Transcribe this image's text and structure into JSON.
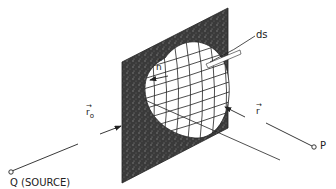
{
  "figure": {
    "labels": {
      "surface_element": "ds",
      "normal": "n",
      "normal_hat": "^",
      "source_vector": "r",
      "source_vector_sub": "o",
      "observer_vector": "r",
      "vector_arrow": "→",
      "source_point": "Q (SOURCE)",
      "observation_point": "P"
    },
    "colors": {
      "screen": "#3a3a3a",
      "aperture": "#ffffff",
      "line": "#222222",
      "background": "#ffffff"
    }
  }
}
